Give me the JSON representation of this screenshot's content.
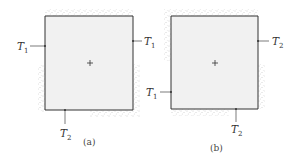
{
  "panels": [
    {
      "id": "a",
      "caption": "(a)",
      "square": {
        "x": 45,
        "y": 16,
        "w": 88,
        "h": 94
      },
      "center_mark": "+",
      "labels": [
        {
          "text": "T",
          "sub": "1",
          "side": "left",
          "pos": 46
        },
        {
          "text": "T",
          "sub": "1",
          "side": "right",
          "pos": 41
        },
        {
          "text": "T",
          "sub": "2",
          "side": "bottom",
          "pos": 65
        }
      ]
    },
    {
      "id": "b",
      "caption": "(b)",
      "square": {
        "x": 171,
        "y": 16,
        "w": 87,
        "h": 93
      },
      "center_mark": "+",
      "labels": [
        {
          "text": "T",
          "sub": "2",
          "side": "right",
          "pos": 41
        },
        {
          "text": "T",
          "sub": "1",
          "side": "left",
          "pos": 92
        },
        {
          "text": "T",
          "sub": "2",
          "side": "bottom",
          "pos": 236
        }
      ]
    }
  ],
  "colors": {
    "square_fill": "#f1f1f1",
    "edge": "#333333",
    "stipple": "#9a9a9a"
  }
}
